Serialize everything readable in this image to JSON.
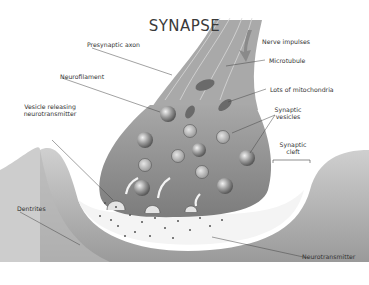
{
  "title": "SYNAPSE",
  "labels": {
    "presynaptic_axon": "Presynaptic axon",
    "nerve_impulses": "Nerve impulses",
    "microtubule": "Microtubule",
    "neurofilament": "Neurofilament",
    "lots_of_mitochondria": "Lots of mitochondria",
    "vesicle_releasing_line1": "Vesicle releasing",
    "vesicle_releasing_line2": "neurotransmitter",
    "synaptic_vesicles_line1": "Synaptic",
    "synaptic_vesicles_line2": "vesicles",
    "synaptic_cleft_line1": "Synaptic",
    "synaptic_cleft_line2": "cleft",
    "dentrites": "Dentrites",
    "neurotransmitter": "Neurotransmitter"
  },
  "colors": {
    "terminal_fill": "#8c8c8c",
    "dendrite_fill": "#a8a8a8",
    "cleft_fill": "#f6f6f6",
    "vesicle_fill": "#b0b0b0",
    "line": "#444444"
  }
}
